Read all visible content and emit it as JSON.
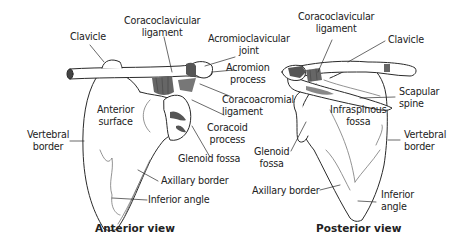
{
  "anterior": {
    "title": "Anterior view",
    "labels": {
      "clavicle": "Clavicle",
      "coracoclavicular_1": "Coracoclavicular",
      "coracoclavicular_2": "ligament",
      "acromioclavicular_1": "Acromioclavicular",
      "acromioclavicular_2": "joint",
      "acromion_1": "Acromion",
      "acromion_2": "process",
      "coracoacromial_1": "Coracoacromial",
      "coracoacromial_2": "ligament",
      "coracoid_1": "Coracoid",
      "coracoid_2": "process",
      "glenoid": "Glenoid fossa",
      "surface_1": "Anterior",
      "surface_2": "surface",
      "vertebral_1": "Vertebral",
      "vertebral_2": "border",
      "axillary": "Axillary border",
      "inferior": "Inferior angle"
    }
  },
  "posterior": {
    "title": "Posterior view",
    "labels": {
      "coracoclavicular_1": "Coracoclavicular",
      "coracoclavicular_2": "ligament",
      "clavicle": "Clavicle",
      "scapular_1": "Scapular",
      "scapular_2": "spine",
      "infraspinous_1": "Infraspinous",
      "infraspinous_2": "fossa",
      "glenoid_1": "Glenoid",
      "glenoid_2": "fossa",
      "vertebral_1": "Vertebral",
      "vertebral_2": "border",
      "axillary": "Axillary border",
      "inferior_1": "Inferior",
      "inferior_2": "angle"
    }
  },
  "colors": {
    "line": "#2a2a2a",
    "ligament": "#6e6e6e",
    "bone_fill": "#ffffff"
  }
}
